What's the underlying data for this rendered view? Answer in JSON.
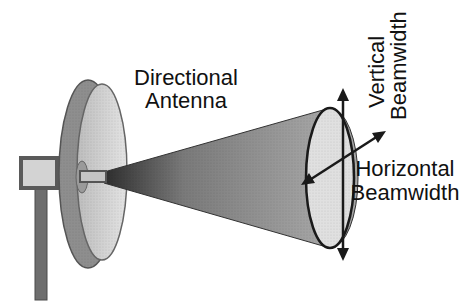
{
  "diagram": {
    "title_line1": "Directional",
    "title_line2": "Antenna",
    "vertical_line1": "Vertical",
    "vertical_line2": "Beamwidth",
    "horizontal_line1": "Horizontal",
    "horizontal_line2": "Beamwidth",
    "colors": {
      "background": "#ffffff",
      "outline": "#1a1a1a",
      "dish_rim": "#8c8c8c",
      "dish_face": "#d6d6d6",
      "mount": "#d0d0d0",
      "pole": "#6a6a6a",
      "beam_dark": "#3a3a3a",
      "beam_light": "#9a9a9a",
      "beam_end": "#e2e2e2"
    }
  }
}
